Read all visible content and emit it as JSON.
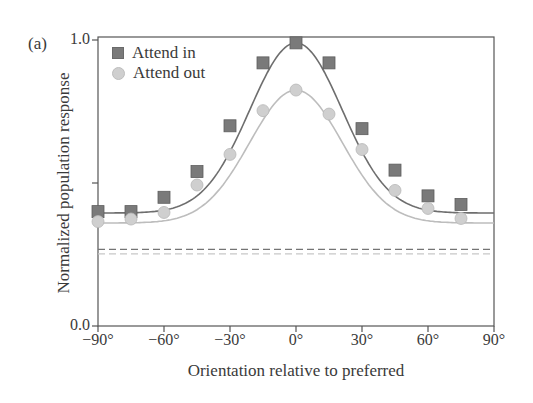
{
  "chart_data": {
    "type": "line",
    "panel_label": "(a)",
    "title": "",
    "xlabel": "Orientation relative to preferred",
    "ylabel": "Normalized population response",
    "xlim": [
      -90,
      90
    ],
    "ylim": [
      0.0,
      1.0
    ],
    "x_ticks": [
      -90,
      -60,
      -30,
      0,
      30,
      60,
      90
    ],
    "x_tick_labels": [
      "−90°",
      "−60°",
      "−30°",
      "0°",
      "30°",
      "60°",
      "90°"
    ],
    "y_ticks": [
      0.0,
      0.5,
      1.0
    ],
    "y_tick_labels": [
      "0.0",
      "",
      "1.0"
    ],
    "grid": false,
    "legend_position": "upper left",
    "x": [
      -90,
      -75,
      -60,
      -45,
      -30,
      -15,
      0,
      15,
      30,
      45,
      60,
      75
    ],
    "series": [
      {
        "name": "Attend in",
        "marker": "square",
        "color": "#747474",
        "values": [
          0.4,
          0.4,
          0.45,
          0.54,
          0.7,
          0.92,
          0.99,
          0.92,
          0.69,
          0.545,
          0.455,
          0.425
        ],
        "fit": "gaussian",
        "baseline_dashed": 0.268
      },
      {
        "name": "Attend out",
        "marker": "circle",
        "color": "#c8c8c8",
        "values": [
          0.365,
          0.374,
          0.397,
          0.493,
          0.6,
          0.753,
          0.825,
          0.741,
          0.617,
          0.474,
          0.411,
          0.376
        ],
        "fit": "gaussian",
        "baseline_dashed": 0.252
      }
    ]
  }
}
